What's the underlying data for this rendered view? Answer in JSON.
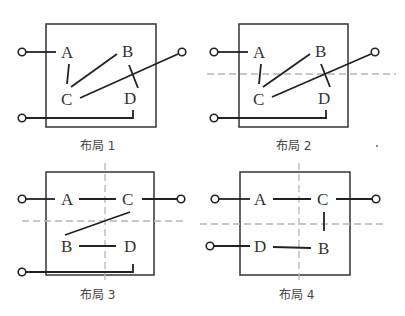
{
  "figure": {
    "layouts": [
      {
        "caption": "布局 1",
        "nodes": {
          "tl": "A",
          "tr": "B",
          "bl": "C",
          "br": "D"
        },
        "divider_horizontal": false,
        "divider_vertical": false
      },
      {
        "caption": "布局 2",
        "nodes": {
          "tl": "A",
          "tr": "B",
          "bl": "C",
          "br": "D"
        },
        "divider_horizontal": true,
        "divider_vertical": false
      },
      {
        "caption": "布局 3",
        "nodes": {
          "tl": "A",
          "tr": "C",
          "bl": "B",
          "br": "D"
        },
        "divider_horizontal": true,
        "divider_vertical": true
      },
      {
        "caption": "布局 4",
        "nodes": {
          "tl": "A",
          "tr": "C",
          "bl": "D",
          "br": "B"
        },
        "divider_horizontal": true,
        "divider_vertical": true
      }
    ],
    "colors": {
      "wire": "#222222",
      "box": "#333333",
      "divider": "#b5b5b5",
      "background": "#ffffff"
    }
  }
}
